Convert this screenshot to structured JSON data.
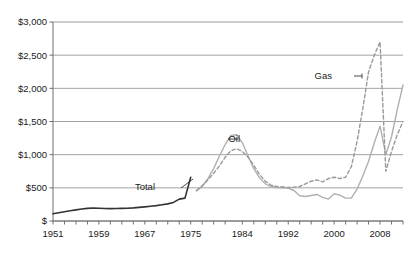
{
  "chart_data": {
    "type": "line",
    "title": "",
    "subtitle": "",
    "xlabel": "",
    "ylabel": "",
    "xlim": [
      1951,
      2012
    ],
    "ylim": [
      0,
      3000
    ],
    "grid": true,
    "grid_axis": "y",
    "legend": "inline-annotations",
    "y_ticks": [
      0,
      500,
      1000,
      1500,
      2000,
      2500,
      3000
    ],
    "y_tick_labels": [
      "$",
      "$500",
      "$1,000",
      "$1,500",
      "$2,000",
      "$2,500",
      "$3,000"
    ],
    "x_ticks": [
      1951,
      1953,
      1955,
      1957,
      1959,
      1961,
      1963,
      1965,
      1967,
      1969,
      1971,
      1973,
      1975,
      1977,
      1979,
      1981,
      1984,
      1986,
      1988,
      1990,
      1992,
      1994,
      1996,
      1998,
      2000,
      2002,
      2004,
      2006,
      2008,
      2010,
      2012
    ],
    "x_tick_labels": [
      "1951",
      "1959",
      "1967",
      "1975",
      "1984",
      "1992",
      "2000",
      "2008"
    ],
    "x_tick_label_values": [
      1951,
      1959,
      1967,
      1975,
      1984,
      1992,
      2000,
      2008
    ],
    "series": [
      {
        "name": "Total",
        "style": "solid",
        "color": "#333333",
        "width": 1.6,
        "label_text": "Total",
        "x": [
          1951,
          1952,
          1953,
          1954,
          1955,
          1956,
          1957,
          1958,
          1959,
          1960,
          1961,
          1962,
          1963,
          1964,
          1965,
          1966,
          1967,
          1968,
          1969,
          1970,
          1971,
          1972,
          1973,
          1974,
          1975
        ],
        "values": [
          110,
          125,
          140,
          155,
          168,
          180,
          190,
          196,
          192,
          188,
          187,
          188,
          190,
          193,
          198,
          205,
          213,
          222,
          232,
          244,
          258,
          280,
          330,
          345,
          660
        ]
      },
      {
        "name": "Oil",
        "style": "solid",
        "color": "#b0b0b0",
        "width": 1.4,
        "label_text": "Oil",
        "x": [
          1976,
          1977,
          1978,
          1979,
          1980,
          1981,
          1982,
          1983,
          1984,
          1985,
          1986,
          1987,
          1988,
          1989,
          1990,
          1991,
          1992,
          1993,
          1994,
          1995,
          1996,
          1997,
          1998,
          1999,
          2000,
          2001,
          2002,
          2003,
          2004,
          2005,
          2006,
          2007,
          2008,
          2009,
          2010,
          2011,
          2012
        ],
        "values": [
          455,
          520,
          640,
          790,
          980,
          1150,
          1290,
          1300,
          1180,
          980,
          790,
          650,
          560,
          520,
          505,
          500,
          495,
          460,
          380,
          370,
          385,
          400,
          355,
          330,
          410,
          390,
          345,
          345,
          480,
          680,
          900,
          1180,
          1430,
          1000,
          1270,
          1680,
          2050
        ]
      },
      {
        "name": "Gas",
        "style": "dashed",
        "color": "#999999",
        "width": 1.4,
        "label_text": "Gas",
        "x": [
          1976,
          1977,
          1978,
          1979,
          1980,
          1981,
          1982,
          1983,
          1984,
          1985,
          1986,
          1987,
          1988,
          1989,
          1990,
          1991,
          1992,
          1993,
          1994,
          1995,
          1996,
          1997,
          1998,
          1999,
          2000,
          2001,
          2002,
          2003,
          2004,
          2005,
          2006,
          2007,
          2008,
          2009,
          2010,
          2011,
          2012
        ],
        "values": [
          460,
          530,
          620,
          720,
          830,
          960,
          1060,
          1090,
          1050,
          960,
          840,
          700,
          600,
          540,
          520,
          515,
          505,
          510,
          520,
          560,
          600,
          620,
          590,
          640,
          660,
          640,
          660,
          820,
          1200,
          1700,
          2250,
          2500,
          2700,
          750,
          1050,
          1300,
          1500
        ]
      }
    ],
    "annotations": [
      {
        "name": "total-label",
        "text": "Total",
        "x_px": 155,
        "y_px": 190,
        "leader": {
          "x1": 181,
          "y1": 188,
          "x2": 193,
          "y2": 179
        }
      },
      {
        "name": "oil-label",
        "text": "Oil",
        "x_px": 240,
        "y_px": 142,
        "leader": {
          "x1": 238,
          "y1": 139,
          "x2": 228,
          "y2": 139
        }
      },
      {
        "name": "gas-label",
        "text": "Gas",
        "x_px": 332,
        "y_px": 79,
        "leader": {
          "x1": 354,
          "y1": 76,
          "x2": 362,
          "y2": 76,
          "tick": true
        }
      }
    ],
    "colors": {
      "axis": "#6e6e6e",
      "grid": "#8c8c8c",
      "total": "#333333",
      "oil": "#b0b0b0",
      "gas": "#999999",
      "text": "#1a1a1a",
      "background": "#ffffff"
    },
    "plot_area_px": {
      "left": 53,
      "right": 403,
      "top": 22,
      "bottom": 221
    }
  }
}
